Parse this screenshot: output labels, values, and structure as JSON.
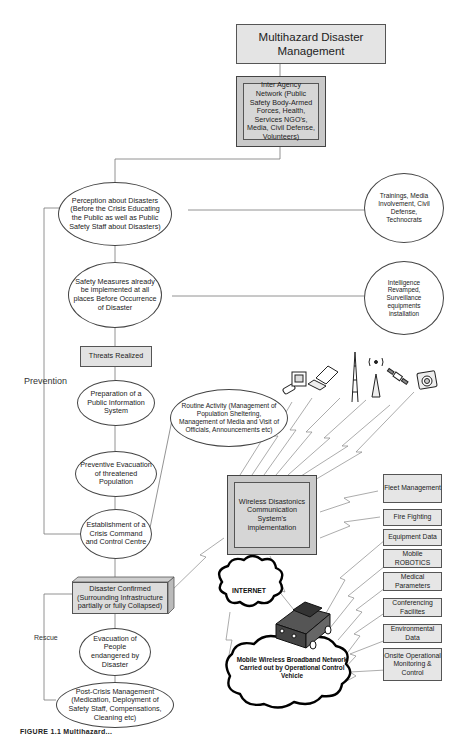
{
  "diagram": {
    "title": "Multihazard Disaster Management",
    "inter_agency": "Inter Agency Network (Public Safety Body-Armed Forces, Health, Services NGO's, Media, Civil Defense, Volunteers)",
    "prevention_label": "Prevention",
    "rescue_label": "Rescue",
    "flow": {
      "perception": "Perception about  Disasters (Before the Crisis Educating the Public as well as Public Safety Staff about Disasters)",
      "safety_measures": "Safety Measures already be implemented at all places Before  Occurrence of Disaster",
      "threats_realized": "Threats Realized",
      "public_info": "Preparation of a Public Information System",
      "preventive_evac": "Preventive Evacuation of threatened Population",
      "crisis_command": "Establishment of a Crisis Command and Control Centre",
      "disaster_confirmed": "Disaster Confirmed (Surrounding Infrastructure partially or fully Collapsed)",
      "evacuation": "Evacuation of People endangered by Disaster",
      "post_crisis": "Post-Crisis Management (Medication, Deployment of Safety Staff,  Compensations, Cleaning etc)"
    },
    "side_nodes": {
      "trainings": "Trainings, Media Involvement, Civil Defense, Technocrats",
      "intelligence": "Intelligence Revamped, Surveillance equipments installation",
      "routine": "Routine Activity (Management of Population Sheltering, Management of Media and Visit of Officials, Announcements etc)"
    },
    "communication": {
      "system": "Wireless Disastonics Communication System's implementation",
      "internet": "INTERNET",
      "mobile_network": "Mobile Wireless Broadband Network Carried out by Operational Control Vehicle",
      "services": [
        "Fleet Management",
        "Fire Fighting",
        "Equipment Data",
        "Mobile ROBOTICS",
        "Medical Parameters",
        "Conferencing Facilites",
        "Environmental Data",
        "Onsite Operational Monitoring & Control"
      ],
      "device_icons": [
        "mobile-phone-icon",
        "computer-icon",
        "laptop-icon",
        "tower-icon",
        "antenna-icon",
        "satellite-icon",
        "camera-icon"
      ]
    },
    "caption": "FIGURE 1.1  Multihazard..."
  }
}
